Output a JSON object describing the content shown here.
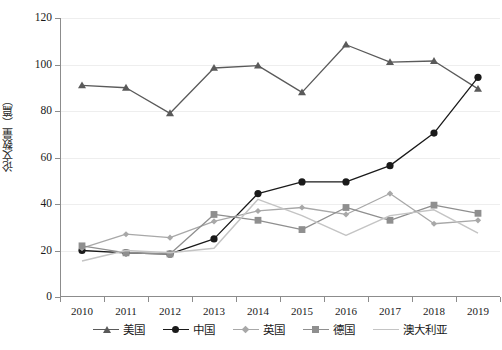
{
  "chart_data": {
    "type": "line",
    "title": "",
    "xlabel": "",
    "ylabel": "论文数量（篇）",
    "categories": [
      "2010",
      "2011",
      "2012",
      "2013",
      "2014",
      "2015",
      "2016",
      "2017",
      "2018",
      "2019"
    ],
    "ylim": [
      0,
      120
    ],
    "yticks": [
      0,
      20,
      40,
      60,
      80,
      100,
      120
    ],
    "grid": true,
    "legend_position": "bottom",
    "series": [
      {
        "name": "美国",
        "marker": "triangle",
        "color": "#5a5a5a",
        "values": [
          91,
          90,
          79,
          98.5,
          99.5,
          88,
          108.5,
          101,
          101.5,
          89.5
        ]
      },
      {
        "name": "中国",
        "marker": "circle",
        "color": "#1a1a1a",
        "values": [
          20,
          19,
          18.5,
          25,
          44.5,
          49.5,
          49.5,
          56.5,
          70.5,
          94.5
        ]
      },
      {
        "name": "英国",
        "marker": "diamond",
        "color": "#a8a8a8",
        "values": [
          21,
          27,
          25.5,
          32.5,
          37,
          38.5,
          35.5,
          44.5,
          31.5,
          33
        ]
      },
      {
        "name": "德国",
        "marker": "square",
        "color": "#8f8f8f",
        "values": [
          22,
          19,
          18.5,
          35.5,
          33,
          29,
          38.5,
          33,
          39.5,
          36
        ]
      },
      {
        "name": "澳大利亚",
        "marker": "none",
        "color": "#c4c4c4",
        "values": [
          15.5,
          20,
          19,
          21,
          42,
          35,
          26.5,
          35,
          37.5,
          27.5
        ]
      }
    ]
  },
  "axis": {
    "y_tick_labels": [
      "0",
      "20",
      "40",
      "60",
      "80",
      "100",
      "120"
    ],
    "x_tick_labels": [
      "2010",
      "2011",
      "2012",
      "2013",
      "2014",
      "2015",
      "2016",
      "2017",
      "2018",
      "2019"
    ],
    "y_axis_title": "论文数量（篇）"
  },
  "legend": {
    "items": [
      {
        "label": "美国"
      },
      {
        "label": "中国"
      },
      {
        "label": "英国"
      },
      {
        "label": "德国"
      },
      {
        "label": "澳大利亚"
      }
    ]
  },
  "caption": {
    "text": ""
  }
}
